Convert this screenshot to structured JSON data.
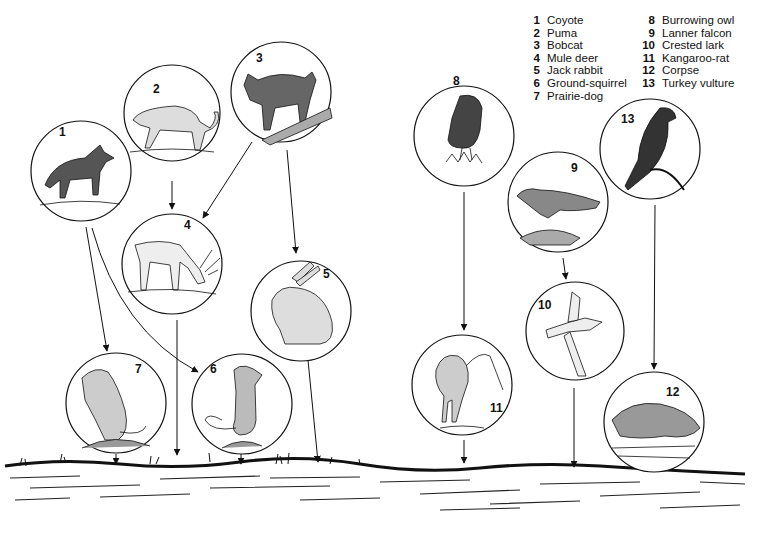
{
  "legend": {
    "column_a": [
      {
        "num": "1",
        "name": "Coyote"
      },
      {
        "num": "2",
        "name": "Puma"
      },
      {
        "num": "3",
        "name": "Bobcat"
      },
      {
        "num": "4",
        "name": "Mule deer"
      },
      {
        "num": "5",
        "name": "Jack rabbit"
      },
      {
        "num": "6",
        "name": "Ground-squirrel"
      },
      {
        "num": "7",
        "name": "Prairie-dog"
      }
    ],
    "column_b": [
      {
        "num": "8",
        "name": "Burrowing owl"
      },
      {
        "num": "9",
        "name": "Lanner falcon"
      },
      {
        "num": "10",
        "name": "Crested lark"
      },
      {
        "num": "11",
        "name": "Kangaroo-rat"
      },
      {
        "num": "12",
        "name": "Corpse"
      },
      {
        "num": "13",
        "name": "Turkey vulture"
      }
    ]
  },
  "nodes": [
    {
      "id": "1",
      "label": "1",
      "animal": "Coyote"
    },
    {
      "id": "2",
      "label": "2",
      "animal": "Puma"
    },
    {
      "id": "3",
      "label": "3",
      "animal": "Bobcat"
    },
    {
      "id": "4",
      "label": "4",
      "animal": "Mule deer"
    },
    {
      "id": "5",
      "label": "5",
      "animal": "Jack rabbit"
    },
    {
      "id": "6",
      "label": "6",
      "animal": "Ground-squirrel"
    },
    {
      "id": "7",
      "label": "7",
      "animal": "Prairie-dog"
    },
    {
      "id": "8",
      "label": "8",
      "animal": "Burrowing owl"
    },
    {
      "id": "9",
      "label": "9",
      "animal": "Lanner falcon"
    },
    {
      "id": "10",
      "label": "10",
      "animal": "Crested lark"
    },
    {
      "id": "11",
      "label": "11",
      "animal": "Kangaroo-rat"
    },
    {
      "id": "12",
      "label": "12",
      "animal": "Corpse"
    },
    {
      "id": "13",
      "label": "13",
      "animal": "Turkey vulture"
    }
  ],
  "edges": [
    {
      "from": "2",
      "to": "4"
    },
    {
      "from": "3",
      "to": "4"
    },
    {
      "from": "3",
      "to": "5"
    },
    {
      "from": "1",
      "to": "7"
    },
    {
      "from": "1",
      "to": "6"
    },
    {
      "from": "4",
      "to": "ground"
    },
    {
      "from": "5",
      "to": "ground"
    },
    {
      "from": "7",
      "to": "ground"
    },
    {
      "from": "6",
      "to": "ground"
    },
    {
      "from": "8",
      "to": "11"
    },
    {
      "from": "9",
      "to": "10"
    },
    {
      "from": "13",
      "to": "12"
    },
    {
      "from": "11",
      "to": "ground"
    },
    {
      "from": "10",
      "to": "ground"
    }
  ]
}
